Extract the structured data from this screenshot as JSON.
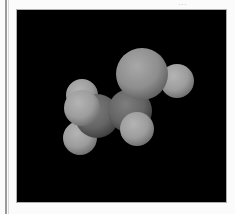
{
  "viewer": {
    "title": "",
    "background": "#000000",
    "molecule": "ethanol",
    "style": "space-filling",
    "atoms": [
      {
        "element": "H",
        "cx": 81,
        "cy": 94,
        "r": 16
      },
      {
        "element": "H",
        "cx": 79,
        "cy": 137,
        "r": 17
      },
      {
        "element": "C",
        "cx": 96,
        "cy": 115,
        "r": 22
      },
      {
        "element": "H",
        "cx": 81,
        "cy": 107,
        "r": 18
      },
      {
        "element": "H",
        "cx": 176,
        "cy": 80,
        "r": 17
      },
      {
        "element": "O",
        "cx": 141,
        "cy": 73,
        "r": 26
      },
      {
        "element": "C",
        "cx": 129,
        "cy": 110,
        "r": 22
      },
      {
        "element": "H",
        "cx": 136,
        "cy": 128,
        "r": 17
      }
    ]
  },
  "header": {
    "clipped_text": "…"
  }
}
